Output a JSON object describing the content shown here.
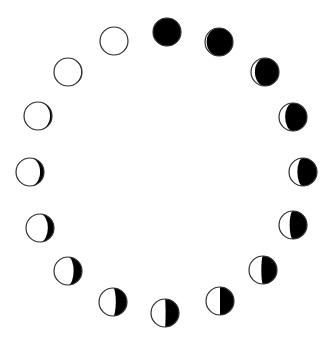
{
  "diagram": {
    "title": "",
    "colors": {
      "dark": "#000000",
      "light": "#ffffff",
      "outline": "#333333"
    },
    "radius": 14,
    "phases": [
      {
        "name": "new-moon",
        "cx": 167,
        "cy": 32,
        "lit": 0.0,
        "side": "left"
      },
      {
        "name": "waxing-crescent-1",
        "cx": 219,
        "cy": 42,
        "lit": 0.06,
        "side": "left"
      },
      {
        "name": "waxing-crescent-2",
        "cx": 265,
        "cy": 72,
        "lit": 0.14,
        "side": "left"
      },
      {
        "name": "waxing-crescent-3",
        "cx": 293,
        "cy": 117,
        "lit": 0.22,
        "side": "left"
      },
      {
        "name": "waxing-crescent-4",
        "cx": 303,
        "cy": 172,
        "lit": 0.3,
        "side": "left"
      },
      {
        "name": "waxing-5",
        "cx": 293,
        "cy": 225,
        "lit": 0.38,
        "side": "left"
      },
      {
        "name": "waxing-6",
        "cx": 263,
        "cy": 270,
        "lit": 0.44,
        "side": "left"
      },
      {
        "name": "quarter-1",
        "cx": 220,
        "cy": 301,
        "lit": 0.5,
        "side": "left"
      },
      {
        "name": "quarter-2",
        "cx": 165,
        "cy": 313,
        "lit": 0.52,
        "side": "left"
      },
      {
        "name": "gibbous-1",
        "cx": 113,
        "cy": 302,
        "lit": 0.6,
        "side": "left"
      },
      {
        "name": "gibbous-2",
        "cx": 68,
        "cy": 271,
        "lit": 0.7,
        "side": "left"
      },
      {
        "name": "gibbous-3",
        "cx": 40,
        "cy": 228,
        "lit": 0.78,
        "side": "left"
      },
      {
        "name": "gibbous-4",
        "cx": 30,
        "cy": 172,
        "lit": 0.86,
        "side": "left"
      },
      {
        "name": "gibbous-5",
        "cx": 38,
        "cy": 116,
        "lit": 0.93,
        "side": "left"
      },
      {
        "name": "gibbous-6",
        "cx": 68,
        "cy": 72,
        "lit": 0.97,
        "side": "left"
      },
      {
        "name": "full-moon",
        "cx": 114,
        "cy": 41,
        "lit": 1.0,
        "side": "left"
      }
    ]
  }
}
